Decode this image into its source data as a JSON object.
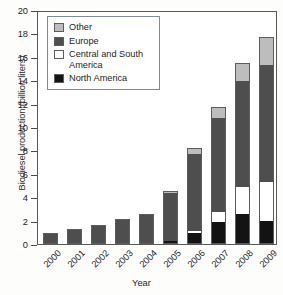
{
  "chart_data": {
    "type": "bar",
    "stacked": true,
    "title": "",
    "xlabel": "Year",
    "ylabel": "Biodiesel production (billion liters)",
    "categories": [
      "2000",
      "2001",
      "2002",
      "2003",
      "2004",
      "2005",
      "2006",
      "2007",
      "2008",
      "2009"
    ],
    "ylim": [
      0,
      20
    ],
    "yticks": [
      0,
      2,
      4,
      6,
      8,
      10,
      12,
      14,
      16,
      18,
      20
    ],
    "grid": false,
    "legend_position": "upper left",
    "series": [
      {
        "name": "North America",
        "color": "#131313",
        "values": [
          0,
          0,
          0,
          0,
          0,
          0.3,
          0.9,
          1.9,
          2.6,
          2.0
        ]
      },
      {
        "name": "Central and South America",
        "color": "#ffffff",
        "values": [
          0,
          0,
          0,
          0,
          0,
          0.0,
          0.2,
          0.8,
          2.3,
          3.3
        ]
      },
      {
        "name": "Europe",
        "color": "#4e4e4e",
        "values": [
          0.9,
          1.25,
          1.6,
          2.1,
          2.6,
          4.1,
          6.6,
          8.1,
          9.0,
          10.0
        ]
      },
      {
        "name": "Other",
        "color": "#bdbdbd",
        "values": [
          0,
          0,
          0,
          0,
          0,
          0.1,
          0.5,
          0.9,
          1.6,
          2.4
        ]
      }
    ],
    "totals": [
      0.9,
      1.25,
      1.6,
      2.1,
      2.6,
      4.5,
      8.2,
      11.7,
      15.5,
      17.7
    ]
  },
  "legend": {
    "entries": [
      {
        "label": "Other",
        "color": "#bdbdbd"
      },
      {
        "label": "Europe",
        "color": "#4e4e4e"
      },
      {
        "label": "Central and South America",
        "color": "#ffffff"
      },
      {
        "label": "North America",
        "color": "#131313"
      }
    ]
  }
}
